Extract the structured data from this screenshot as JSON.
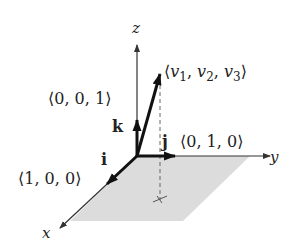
{
  "diagram": {
    "axes": {
      "x": "x",
      "y": "y",
      "z": "z"
    },
    "unit_vectors": {
      "i": {
        "symbol": "i",
        "coords": "⟨1, 0, 0⟩"
      },
      "j": {
        "symbol": "j",
        "coords": "⟨0, 1, 0⟩"
      },
      "k": {
        "symbol": "k",
        "coords": "⟨0, 0, 1⟩"
      }
    },
    "vector_v": {
      "open": "⟨",
      "v1": "v",
      "sub1": "1",
      "v2": "v",
      "sub2": "2",
      "v3": "v",
      "sub3": "3",
      "sep": ", ",
      "close": "⟩"
    },
    "colors": {
      "axis": "#333333",
      "vector": "#111111",
      "plane_fill": "#dcdcdc",
      "dashed": "#666666"
    }
  }
}
